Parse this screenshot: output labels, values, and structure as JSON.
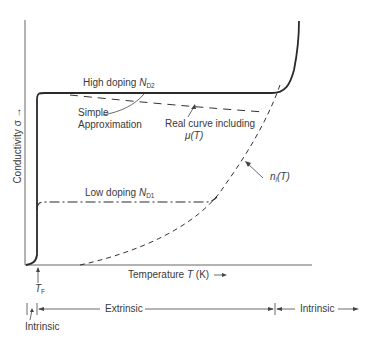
{
  "figure": {
    "y_axis_label": "Conductivity σ",
    "y_axis_arrow": "→",
    "x_axis_label": "Temperature",
    "x_axis_symbol": "T",
    "x_axis_unit": "(K)",
    "x_axis_arrow": "→",
    "tf_label": "T",
    "tf_sub": "F"
  },
  "curves": {
    "high_doping_label": "High doping",
    "high_doping_symbol": "N",
    "high_doping_sub": "D2",
    "low_doping_label": "Low doping",
    "low_doping_symbol": "N",
    "low_doping_sub": "D1",
    "simple_approx_line1": "Simple",
    "simple_approx_line2": "Approximation",
    "real_curve_line1": "Real curve including",
    "real_curve_line2": "μ(T)",
    "ni_label": "n",
    "ni_sub": "i",
    "ni_arg": "(T)"
  },
  "regions": {
    "intrinsic_low": "Intrinsic",
    "extrinsic": "Extrinsic",
    "intrinsic_high": "Intrinsic"
  },
  "colors": {
    "line": "#2a2a2a",
    "axis": "#555555",
    "text": "#3a3a3a"
  }
}
